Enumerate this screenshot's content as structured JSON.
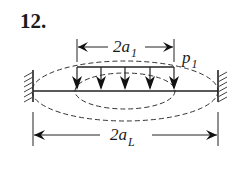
{
  "problem": {
    "number_label": "12."
  },
  "diagram": {
    "stroke_color": "#222222",
    "beam": {
      "x1": 33,
      "x2": 218,
      "y": 91
    },
    "load": {
      "label_main": "p",
      "label_sub": "1",
      "top_y": 67,
      "x_start": 77,
      "x_end": 174,
      "arrow_x": [
        77,
        101,
        125,
        150,
        174
      ]
    },
    "dimension_top": {
      "label_main": "2a",
      "label_sub": "1",
      "y": 47,
      "x_start": 77,
      "x_end": 174
    },
    "dimension_bottom": {
      "label_main": "2a",
      "label_sub": "L",
      "y": 135,
      "x_start": 33,
      "x_end": 218
    },
    "ellipses": [
      {
        "name": "outer-crack-boundary",
        "cx": 125,
        "cy": 91,
        "rx": 93,
        "ry": 30
      },
      {
        "name": "inner-load-region",
        "cx": 125,
        "cy": 91,
        "rx": 50,
        "ry": 18
      }
    ],
    "supports": [
      "left-fixed-wall",
      "right-fixed-wall"
    ]
  }
}
